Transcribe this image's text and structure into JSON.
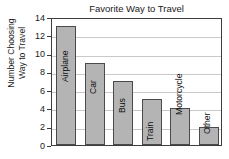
{
  "chart_data": {
    "type": "bar",
    "title": "Favorite Way to Travel",
    "xlabel": "",
    "ylabel": "Number Choosing Way to Travel",
    "ylabel_lines": [
      "Number Choosing",
      "Way to Travel"
    ],
    "categories": [
      "Airplane",
      "Car",
      "Bus",
      "Train",
      "Motorcycle",
      "Other"
    ],
    "values": [
      13,
      9,
      7,
      5,
      4,
      2
    ],
    "ylim": [
      0,
      14
    ],
    "ytick_step": 2,
    "ytick_labels": [
      "14",
      "12",
      "10",
      "8",
      "6",
      "4",
      "2",
      "0"
    ],
    "ytick_values": [
      14,
      12,
      10,
      8,
      6,
      4,
      2,
      0
    ],
    "grid": "horizontal",
    "legend": "none",
    "bar_label_rotation": -90,
    "colors": {
      "bar_fill": "#b4b4b4",
      "bar_stroke": "#4a4a4a",
      "gridline": "#c9c9c9",
      "axis_frame": "#3d3d3d",
      "text": "#1a1a1a",
      "background": "#ffffff"
    }
  }
}
